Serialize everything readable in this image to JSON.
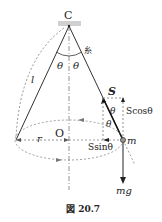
{
  "figure": {
    "caption": "図 20.7",
    "labels": {
      "pivot": "C",
      "string": "糸",
      "theta_left": "θ",
      "theta_right": "θ",
      "theta_mass1": "θ",
      "theta_mass2": "θ",
      "length": "l",
      "center": "O",
      "radius": "r",
      "tension": "S",
      "tension_vertical": "Scosθ",
      "tension_horizontal": "Ssinθ",
      "mass": "m",
      "weight": "mg"
    },
    "colors": {
      "line": "#222222",
      "dashed": "#888888",
      "ceiling": "#cccccc"
    }
  }
}
